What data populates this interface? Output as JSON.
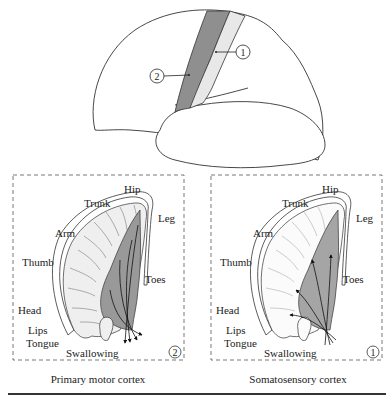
{
  "brain": {
    "callouts": [
      {
        "id": "1",
        "label": "1"
      },
      {
        "id": "2",
        "label": "2"
      }
    ],
    "colors": {
      "motor_strip": "#8f8f8f",
      "sensory_strip": "#e8e8e8",
      "outline": "#333333"
    }
  },
  "panels": [
    {
      "caption": "Primary motor cortex",
      "badge": "2",
      "labels": {
        "hip": "Hip",
        "trunk": "Trunk",
        "leg": "Leg",
        "arm": "Arm",
        "thumb": "Thumb",
        "toes": "Toes",
        "head": "Head",
        "lips": "Lips",
        "tongue": "Tongue",
        "swallowing": "Swallowing"
      }
    },
    {
      "caption": "Somatosensory cortex",
      "badge": "1",
      "labels": {
        "hip": "Hip",
        "trunk": "Trunk",
        "leg": "Leg",
        "arm": "Arm",
        "thumb": "Thumb",
        "toes": "Toes",
        "head": "Head",
        "lips": "Lips",
        "tongue": "Tongue",
        "swallowing": "Swallowing"
      }
    }
  ]
}
